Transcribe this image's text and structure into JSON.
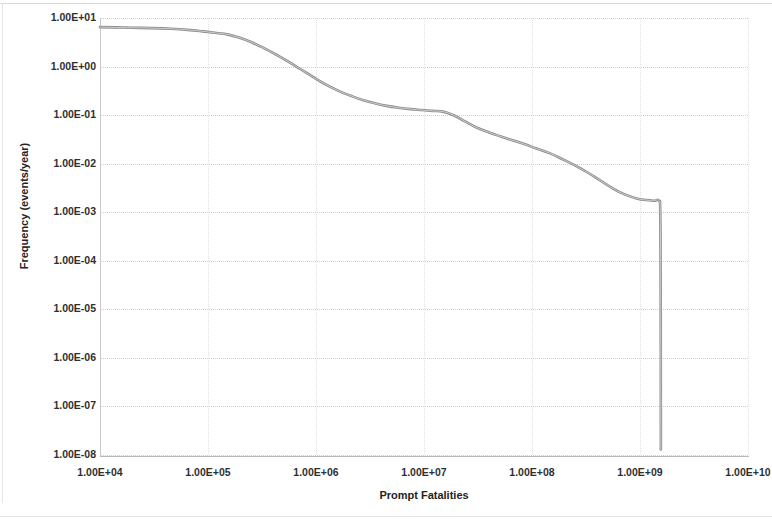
{
  "chart_data": {
    "type": "line",
    "title": "",
    "xlabel": "Prompt Fatalities",
    "ylabel": "Frequency (events/year)",
    "xscale": "log",
    "yscale": "log",
    "xlim": [
      10000,
      10000000000
    ],
    "ylim": [
      1e-08,
      10
    ],
    "grid": true,
    "legend": null,
    "legend_position": "none",
    "xticks": [
      "1.00E+04",
      "1.00E+05",
      "1.00E+06",
      "1.00E+07",
      "1.00E+08",
      "1.00E+09",
      "1.00E+10"
    ],
    "xtick_values": [
      10000,
      100000,
      1000000,
      10000000,
      100000000,
      1000000000,
      10000000000
    ],
    "yticks": [
      "1.00E+01",
      "1.00E+00",
      "1.00E-01",
      "1.00E-02",
      "1.00E-03",
      "1.00E-04",
      "1.00E-05",
      "1.00E-06",
      "1.00E-07",
      "1.00E-08"
    ],
    "ytick_values": [
      10,
      1,
      0.1,
      0.01,
      0.001,
      0.0001,
      1e-05,
      1e-06,
      1e-07,
      1e-08
    ],
    "line_color": "#8a8a8a",
    "series": [
      {
        "name": "Complementary cumulative frequency of prompt fatalities",
        "x": [
          10000,
          14000,
          20000,
          30000,
          45000,
          65000,
          90000,
          120000,
          150000,
          190000,
          250000,
          330000,
          430000,
          560000,
          720000,
          930000,
          1200000,
          1600000,
          2100000,
          2700000,
          3500000,
          4500000,
          5800000,
          7500000,
          9700000,
          12000000,
          15000000,
          19000000,
          24000000,
          31000000,
          40000000,
          52000000,
          67000000,
          86000000,
          110000000,
          145000000,
          190000000,
          250000000,
          330000000,
          430000000,
          560000000,
          730000000,
          950000000,
          1150000000,
          1350000000,
          1500000000,
          1540000000,
          1555000000,
          1560000000
        ],
        "y": [
          6.5,
          6.4,
          6.3,
          6.2,
          6.0,
          5.7,
          5.3,
          4.9,
          4.6,
          4.0,
          3.2,
          2.4,
          1.75,
          1.25,
          0.88,
          0.62,
          0.44,
          0.32,
          0.25,
          0.205,
          0.175,
          0.155,
          0.142,
          0.133,
          0.127,
          0.122,
          0.118,
          0.098,
          0.074,
          0.055,
          0.044,
          0.036,
          0.03,
          0.025,
          0.0205,
          0.0165,
          0.0125,
          0.0092,
          0.0065,
          0.0045,
          0.0031,
          0.0023,
          0.0019,
          0.00178,
          0.00172,
          0.0017,
          0.0009,
          2e-05,
          1.3e-08
        ]
      }
    ],
    "annotations": [
      {
        "text": "plateau near 1E+07 fatalities at ~1.2E-01 events/year",
        "x": 12000000,
        "y": 0.122
      },
      {
        "text": "shoulder near 1.3E+09 fatalities at ~1.7E-03 events/year",
        "x": 1350000000,
        "y": 0.00172
      },
      {
        "text": "vertical cut-off at ~1.56E+09 fatalities dropping to ~1.3E-08 events/year",
        "x": 1560000000,
        "y": 1.3e-08
      }
    ]
  },
  "axes": {
    "x_title": "Prompt Fatalities",
    "y_title": "Frequency (events/year)"
  }
}
